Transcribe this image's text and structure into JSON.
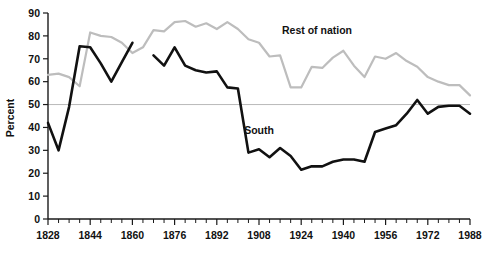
{
  "chart_data": {
    "type": "line",
    "title": "",
    "subtitle": "",
    "xlabel": "",
    "ylabel": "Percent",
    "xlim": [
      1828,
      1988
    ],
    "ylim": [
      0,
      90
    ],
    "grid": false,
    "reference_lines": [
      {
        "axis": "y",
        "value": 50,
        "color": "#b9b9b9"
      }
    ],
    "y_ticks": [
      0,
      10,
      20,
      30,
      40,
      50,
      60,
      70,
      80,
      90
    ],
    "y_tick_labels": [
      "0",
      "10",
      "20",
      "30",
      "40",
      "50",
      "60",
      "70",
      "80",
      "90"
    ],
    "x_ticks": [
      1828,
      1832,
      1836,
      1840,
      1844,
      1848,
      1852,
      1856,
      1860,
      1864,
      1868,
      1872,
      1876,
      1880,
      1884,
      1888,
      1892,
      1896,
      1900,
      1904,
      1908,
      1912,
      1916,
      1920,
      1924,
      1928,
      1932,
      1936,
      1940,
      1944,
      1948,
      1952,
      1956,
      1960,
      1964,
      1968,
      1972,
      1976,
      1980,
      1984,
      1988
    ],
    "x_tick_labels": [
      "1828",
      "1844",
      "1860",
      "1876",
      "1892",
      "1908",
      "1924",
      "1940",
      "1956",
      "1972",
      "1988"
    ],
    "x_labeled_ticks": [
      1828,
      1844,
      1860,
      1876,
      1892,
      1908,
      1924,
      1940,
      1956,
      1972,
      1988
    ],
    "legend_position": "inline-annotation",
    "series": [
      {
        "name": "Rest of nation",
        "color": "#bdbdbd",
        "label_x": 1930,
        "label_y": 81,
        "x": [
          1828,
          1832,
          1836,
          1840,
          1844,
          1848,
          1852,
          1856,
          1860,
          1864,
          1868,
          1872,
          1876,
          1880,
          1884,
          1888,
          1892,
          1896,
          1900,
          1904,
          1908,
          1912,
          1916,
          1920,
          1924,
          1928,
          1932,
          1936,
          1940,
          1944,
          1948,
          1952,
          1956,
          1960,
          1964,
          1968,
          1972,
          1976,
          1980,
          1984,
          1988
        ],
        "values": [
          63,
          63.5,
          62,
          58,
          81.5,
          80,
          79.5,
          77,
          72.5,
          75,
          82.5,
          82,
          86,
          86.5,
          84,
          85.5,
          83,
          86,
          83,
          78.5,
          77,
          71,
          71.5,
          57.5,
          57.5,
          66.5,
          66,
          70.5,
          73.5,
          67,
          62,
          71,
          70,
          72.5,
          69,
          66.5,
          62,
          60,
          58.5,
          58.5,
          54
        ]
      },
      {
        "name": "South",
        "color": "#111111",
        "label_x": 1908,
        "label_y": 37,
        "segments": [
          {
            "x": [
              1828,
              1832,
              1836,
              1840,
              1844,
              1848,
              1852,
              1856,
              1860
            ],
            "values": [
              42,
              30,
              49,
              75.5,
              75,
              68,
              60,
              68.5,
              77
            ]
          },
          {
            "x": [
              1868,
              1872,
              1876,
              1880,
              1884,
              1888,
              1892,
              1896,
              1900,
              1904,
              1908,
              1912,
              1916,
              1920,
              1924,
              1928,
              1932,
              1936,
              1940,
              1944,
              1948,
              1952,
              1956,
              1960,
              1964,
              1968,
              1972,
              1976,
              1980,
              1984,
              1988
            ],
            "values": [
              71.5,
              67,
              75,
              67,
              65,
              64,
              64.5,
              57.5,
              57,
              29,
              30.5,
              27,
              31,
              27.5,
              21.5,
              23,
              23,
              25,
              26,
              26,
              25,
              38,
              39.5,
              41,
              46,
              52,
              46,
              49,
              49.5,
              49.5,
              46
            ]
          }
        ]
      }
    ]
  }
}
